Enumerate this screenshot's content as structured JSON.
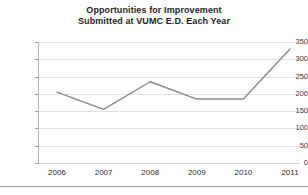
{
  "chart_data": {
    "type": "line",
    "title": "Opportunities for Improvement Submitted at VUMC E.D. Each Year",
    "title_line1": "Opportunities for Improvement",
    "title_line2": "Submitted at VUMC E.D. Each Year",
    "xlabel": "",
    "ylabel": "",
    "categories": [
      "2006",
      "2007",
      "2008",
      "2009",
      "2010",
      "2011"
    ],
    "values": [
      205,
      155,
      235,
      185,
      185,
      330
    ],
    "series": [
      {
        "name": "Opportunities for Improvement Submitted",
        "values": [
          205,
          155,
          235,
          185,
          185,
          330
        ]
      }
    ],
    "ylim": [
      0,
      350
    ],
    "yticks": [
      0,
      50,
      100,
      150,
      200,
      250,
      300,
      350
    ],
    "ytick_labels": [
      "0",
      "50",
      "100",
      "150",
      "200",
      "250",
      "300",
      "350"
    ],
    "grid": true,
    "grid_axis": "y",
    "legend": false,
    "legend_position": "none",
    "markers": false,
    "line_color": "#8a8a8a",
    "grid_color": "#e2e2e4",
    "text_color": "#2b2b2b",
    "background": "#ffffff"
  }
}
